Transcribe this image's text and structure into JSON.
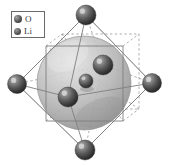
{
  "figure": {
    "background_color": "#ffffff",
    "width": 169,
    "height": 166
  },
  "legend": {
    "border_color": "#6a6a6a",
    "items": [
      {
        "label": "O",
        "icon": "sphere-icon",
        "radius": 4.0,
        "color": "#5a5a5a"
      },
      {
        "label": "Li",
        "icon": "sphere-icon",
        "radius": 3.5,
        "color": "#5a5a5a"
      }
    ]
  },
  "structure": {
    "isosurface": {
      "name": "charge-density-isosurface",
      "cx": 84,
      "cy": 83,
      "rx": 47,
      "ry": 47,
      "fill": "#b4b4b4",
      "opacity": 0.86
    },
    "edges_solid_color": "#8d8d8d",
    "edges_dashed_color": "#8d8d8d",
    "octahedron_vertices": [
      {
        "name": "oxygen-top",
        "element": "O",
        "x": 86,
        "y": 15,
        "r": 10.0
      },
      {
        "name": "oxygen-left",
        "element": "O",
        "x": 17,
        "y": 84,
        "r": 9.5
      },
      {
        "name": "oxygen-right",
        "element": "O",
        "x": 152,
        "y": 83,
        "r": 9.5
      },
      {
        "name": "oxygen-bottom",
        "element": "O",
        "x": 85,
        "y": 150,
        "r": 10.0
      },
      {
        "name": "oxygen-front",
        "element": "O",
        "x": 68,
        "y": 97,
        "r": 10.0
      },
      {
        "name": "oxygen-back",
        "element": "O",
        "x": 103,
        "y": 65,
        "r": 10.0
      }
    ],
    "inner_atoms": [
      {
        "name": "lithium-center",
        "element": "Li",
        "x": 86,
        "y": 81,
        "r": 7.0
      }
    ],
    "cube_corners": [
      {
        "x": 46,
        "y": 46
      },
      {
        "x": 123,
        "y": 46
      },
      {
        "x": 123,
        "y": 121
      },
      {
        "x": 46,
        "y": 121
      },
      {
        "x": 62,
        "y": 34
      },
      {
        "x": 139,
        "y": 34
      },
      {
        "x": 139,
        "y": 109
      },
      {
        "x": 62,
        "y": 109
      }
    ]
  }
}
